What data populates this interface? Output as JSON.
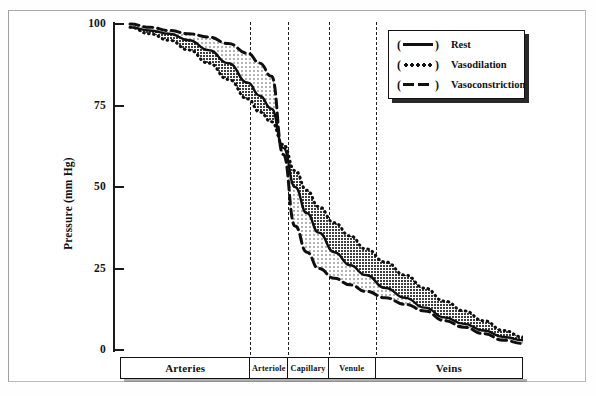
{
  "figure": {
    "caption_truncated": ""
  },
  "axes": {
    "y": {
      "label": "Pressure (mm Hg)",
      "ticks": [
        0,
        25,
        50,
        75,
        100
      ],
      "min": 0,
      "max": 100,
      "unit": "mm Hg"
    }
  },
  "segments": [
    {
      "label": "Arteries",
      "start": 0,
      "end": 250
    },
    {
      "label": "Arteriole",
      "start": 250,
      "end": 288
    },
    {
      "label": "Capillary",
      "start": 288,
      "end": 329
    },
    {
      "label": "Venule",
      "start": 329,
      "end": 376
    },
    {
      "label": "Veins",
      "start": 376,
      "end": 523
    }
  ],
  "legend": {
    "position": "top-right",
    "items": [
      {
        "label": "Rest",
        "style": "solid",
        "sample": "solid-line-sample",
        "color": "#111111"
      },
      {
        "label": "Vasodilation",
        "style": "dotted",
        "sample": "dotted-line-sample",
        "color": "#111111"
      },
      {
        "label": "Vasoconstriction",
        "style": "dashed",
        "sample": "dashed-line-sample",
        "color": "#111111"
      }
    ]
  },
  "shading": {
    "dark_band": "between Rest and Vasodilation",
    "light_band": "between Rest and Vasoconstriction",
    "dark_color": "#4a4a4a",
    "light_color": "#d0d0d0"
  },
  "chart_data": {
    "type": "line",
    "xlabel": "",
    "ylabel": "Pressure (mm Hg)",
    "ylim": [
      0,
      100
    ],
    "grid": false,
    "legend_position": "top-right",
    "x_categories": [
      "Arteries",
      "Arteriole",
      "Capillary",
      "Venule",
      "Veins"
    ],
    "x_boundaries_px": [
      250,
      288,
      329,
      376
    ],
    "x": [
      0,
      5,
      10,
      15,
      20,
      25,
      30,
      33,
      36,
      39,
      42,
      45,
      48,
      52,
      56,
      60,
      65,
      70,
      75,
      80,
      85,
      90,
      95,
      100
    ],
    "series": [
      {
        "name": "Rest",
        "style": "solid",
        "values": [
          99,
          98,
          97,
          95,
          92,
          88,
          82,
          78,
          74,
          62,
          50,
          42,
          36,
          30,
          26,
          23,
          19,
          16,
          13,
          10,
          8,
          6,
          4,
          3
        ]
      },
      {
        "name": "Vasodilation",
        "style": "dotted",
        "values": [
          99,
          97,
          95,
          92,
          88,
          83,
          77,
          73,
          70,
          63,
          55,
          49,
          44,
          39,
          35,
          31,
          27,
          23,
          19,
          15,
          12,
          9,
          6,
          4
        ]
      },
      {
        "name": "Vasoconstriction",
        "style": "dashed",
        "values": [
          100,
          99,
          98,
          97,
          96,
          94,
          91,
          88,
          84,
          60,
          38,
          30,
          25,
          22,
          20,
          18,
          16,
          14,
          12,
          9,
          7,
          5,
          3,
          2
        ]
      }
    ],
    "annotations": [
      "All three curves begin together near 100 mm Hg in the large arteries",
      "Steep pressure drop occurs across the arterioles",
      "Vasoconstriction lies above the others in the arteries, then falls below after the arteriolar drop",
      "Vasodilation lies below in the arteries, then remains highest downstream",
      "Curves converge near 2-4 mm Hg in the large veins"
    ]
  }
}
